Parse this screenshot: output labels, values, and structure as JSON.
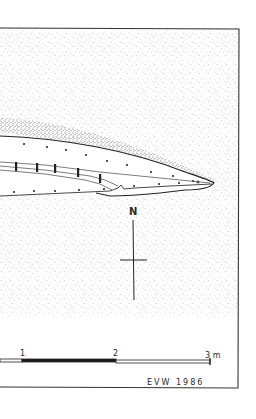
{
  "drawing": {
    "type": "archaeological site plan (cropped)",
    "stipple_color": "#8a8a8a",
    "line_color": "#2a2a2a",
    "background": "#ffffff"
  },
  "north_arrow": {
    "label": "N"
  },
  "scale_bar": {
    "ticks": [
      "1",
      "2",
      "3 m"
    ],
    "unit": "m",
    "segments": [
      {
        "from": "1",
        "to": "2",
        "fill": "#1a1a1a"
      },
      {
        "from": "2",
        "to": "3",
        "fill": "#ffffff"
      }
    ]
  },
  "signature": {
    "text": "EVW 1986"
  }
}
